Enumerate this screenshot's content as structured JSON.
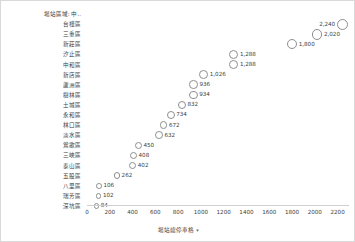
{
  "chart_data": {
    "type": "scatter",
    "title": "",
    "xlabel": "場站總停車格",
    "ylabel": "場站區域",
    "xlim": [
      0,
      2300
    ],
    "grid": false,
    "legend": null,
    "categories": [
      "台樺區",
      "三重區",
      "新莊區",
      "汐止區",
      "中和區",
      "新店區",
      "蘆洲區",
      "樹林區",
      "土城區",
      "永和區",
      "林口區",
      "淡水區",
      "鶯歌區",
      "三峽區",
      "泰山區",
      "五股區",
      "八里區",
      "瑞芳區",
      "深坑區"
    ],
    "values": [
      2240,
      2020,
      1800,
      1288,
      1288,
      1026,
      936,
      934,
      832,
      734,
      672,
      632,
      450,
      408,
      402,
      262,
      106,
      102,
      84
    ],
    "value_labels": [
      "2,240",
      "2,020",
      "1,800",
      "1,288",
      "1,288",
      "1,026",
      "936",
      "934",
      "832",
      "734",
      "672",
      "632",
      "450",
      "408",
      "402",
      "262",
      "106",
      "102",
      "84"
    ],
    "label_side": [
      "left",
      "right",
      "right",
      "right",
      "right",
      "right",
      "right",
      "right",
      "right",
      "right",
      "right",
      "right",
      "right",
      "right",
      "right",
      "right",
      "right",
      "right",
      "right"
    ],
    "xticks": [
      0,
      200,
      400,
      600,
      800,
      1000,
      1200,
      1400,
      1600,
      1800,
      2000,
      2200
    ],
    "xtick_labels": [
      "0",
      "200",
      "400",
      "600",
      "800",
      "1000",
      "1200",
      "1400",
      "1600",
      "1800",
      "2000",
      "2200"
    ],
    "marker": {
      "shape": "circle",
      "filled": false,
      "edge_color": "#8e8e8e",
      "size_encodes_value": true,
      "min_diameter_px": 5.5,
      "max_diameter_px": 11
    }
  },
  "axes": {
    "category_header": {
      "label": "場站區域: 中..",
      "caret": "▾"
    },
    "value_title": {
      "label": "場站總停車格",
      "caret": "▾"
    }
  },
  "colors": {
    "background": "#ffffff",
    "frame_border": "#d9d9d9",
    "text": "#3c3c3c",
    "marker_edge": "#8e8e8e",
    "axis_line": "#d0d0d0"
  }
}
